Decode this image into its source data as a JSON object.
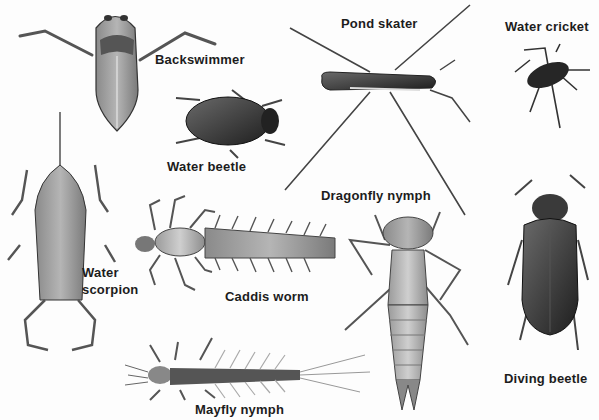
{
  "illustration": {
    "subject": "Freshwater pond insects",
    "style": "grayscale illustration plate",
    "labels": [
      {
        "id": "backswimmer",
        "text": "Backswimmer"
      },
      {
        "id": "water-beetle",
        "text": "Water beetle"
      },
      {
        "id": "pond-skater",
        "text": "Pond skater"
      },
      {
        "id": "water-cricket",
        "text": "Water cricket"
      },
      {
        "id": "water-scorpion-line1",
        "text": "Water"
      },
      {
        "id": "water-scorpion-line2",
        "text": "scorpion"
      },
      {
        "id": "caddis-worm",
        "text": "Caddis worm"
      },
      {
        "id": "dragonfly-nymph",
        "text": "Dragonfly nymph"
      },
      {
        "id": "diving-beetle",
        "text": "Diving beetle"
      },
      {
        "id": "mayfly-nymph",
        "text": "Mayfly nymph"
      }
    ]
  }
}
